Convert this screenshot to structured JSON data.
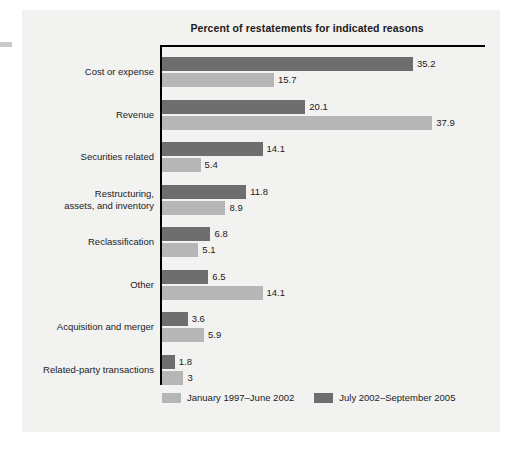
{
  "chart_data": {
    "type": "bar",
    "orientation": "horizontal",
    "title": "Percent of restatements for indicated reasons",
    "xlabel": "",
    "ylabel": "",
    "xlim": [
      0,
      45
    ],
    "grid": false,
    "legend_position": "bottom-left",
    "categories": [
      "Cost or expense",
      "Revenue",
      "Securities related",
      "Restructuring,\nassets, and inventory",
      "Reclassification",
      "Other",
      "Acquisition and merger",
      "Related-party transactions"
    ],
    "series": [
      {
        "name": "July 2002–September 2005",
        "color": "#6e6e6e",
        "values": [
          35.2,
          20.1,
          14.1,
          11.8,
          6.8,
          6.5,
          3.6,
          1.8
        ],
        "labels": [
          "35.2",
          "20.1",
          "14.1",
          "11.8",
          "6.8",
          "6.5",
          "3.6",
          "1.8"
        ]
      },
      {
        "name": "January 1997–June 2002",
        "color": "#b6b6b6",
        "values": [
          15.7,
          37.9,
          5.4,
          8.9,
          5.1,
          14.1,
          5.9,
          3.0
        ],
        "labels": [
          "15.7",
          "37.9",
          "5.4",
          "8.9",
          "5.1",
          "14.1",
          "5.9",
          "3"
        ]
      }
    ]
  },
  "legend": {
    "items": [
      {
        "label": "January 1997–June 2002",
        "color": "#b6b6b6"
      },
      {
        "label": "July 2002–September 2005",
        "color": "#6e6e6e"
      }
    ]
  }
}
